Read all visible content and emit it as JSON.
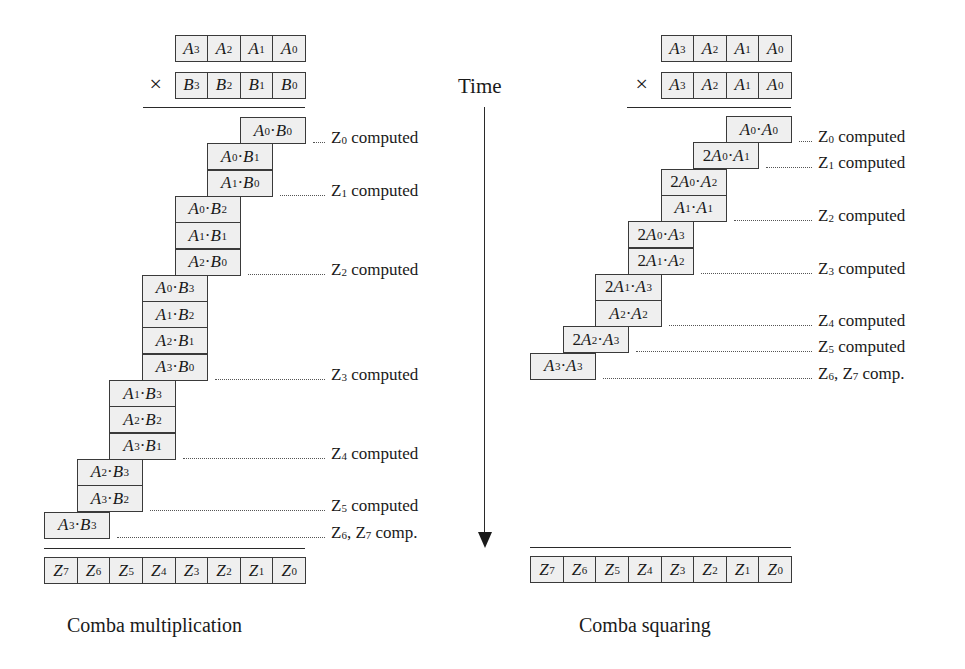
{
  "time_axis": {
    "label": "Time",
    "icon": "down-arrow-icon"
  },
  "multiplication": {
    "caption": "Comba multiplication",
    "times_symbol": "×",
    "operand_a": [
      "A3",
      "A2",
      "A1",
      "A0"
    ],
    "operand_b": [
      "B3",
      "B2",
      "B1",
      "B0"
    ],
    "result": [
      "Z7",
      "Z6",
      "Z5",
      "Z4",
      "Z3",
      "Z2",
      "Z1",
      "Z0"
    ],
    "products": [
      {
        "a": "A0",
        "b": "B0",
        "col": 0
      },
      {
        "a": "A0",
        "b": "B1",
        "col": 1
      },
      {
        "a": "A1",
        "b": "B0",
        "col": 1
      },
      {
        "a": "A0",
        "b": "B2",
        "col": 2
      },
      {
        "a": "A1",
        "b": "B1",
        "col": 2
      },
      {
        "a": "A2",
        "b": "B0",
        "col": 2
      },
      {
        "a": "A0",
        "b": "B3",
        "col": 3
      },
      {
        "a": "A1",
        "b": "B2",
        "col": 3
      },
      {
        "a": "A2",
        "b": "B1",
        "col": 3
      },
      {
        "a": "A3",
        "b": "B0",
        "col": 3
      },
      {
        "a": "A1",
        "b": "B3",
        "col": 4
      },
      {
        "a": "A2",
        "b": "B2",
        "col": 4
      },
      {
        "a": "A3",
        "b": "B1",
        "col": 4
      },
      {
        "a": "A2",
        "b": "B3",
        "col": 5
      },
      {
        "a": "A3",
        "b": "B2",
        "col": 5
      },
      {
        "a": "A3",
        "b": "B3",
        "col": 6
      }
    ],
    "milestones": [
      {
        "after_row": 0,
        "label": "Z0 computed"
      },
      {
        "after_row": 2,
        "label": "Z1 computed"
      },
      {
        "after_row": 5,
        "label": "Z2 computed"
      },
      {
        "after_row": 9,
        "label": "Z3 computed"
      },
      {
        "after_row": 12,
        "label": "Z4 computed"
      },
      {
        "after_row": 14,
        "label": "Z5 computed"
      },
      {
        "after_row": 15,
        "label": "Z6, Z7 comp."
      }
    ]
  },
  "squaring": {
    "caption": "Comba squaring",
    "times_symbol": "×",
    "operand_a": [
      "A3",
      "A2",
      "A1",
      "A0"
    ],
    "operand_b": [
      "A3",
      "A2",
      "A1",
      "A0"
    ],
    "result": [
      "Z7",
      "Z6",
      "Z5",
      "Z4",
      "Z3",
      "Z2",
      "Z1",
      "Z0"
    ],
    "products": [
      {
        "coef": "",
        "a": "A0",
        "b": "A0",
        "col": 0
      },
      {
        "coef": "2",
        "a": "A0",
        "b": "A1",
        "col": 1
      },
      {
        "coef": "2",
        "a": "A0",
        "b": "A2",
        "col": 2
      },
      {
        "coef": "",
        "a": "A1",
        "b": "A1",
        "col": 2
      },
      {
        "coef": "2",
        "a": "A0",
        "b": "A3",
        "col": 3
      },
      {
        "coef": "2",
        "a": "A1",
        "b": "A2",
        "col": 3
      },
      {
        "coef": "2",
        "a": "A1",
        "b": "A3",
        "col": 4
      },
      {
        "coef": "",
        "a": "A2",
        "b": "A2",
        "col": 4
      },
      {
        "coef": "2",
        "a": "A2",
        "b": "A3",
        "col": 5
      },
      {
        "coef": "",
        "a": "A3",
        "b": "A3",
        "col": 6
      }
    ],
    "milestones": [
      {
        "after_row": 0,
        "label": "Z0 computed"
      },
      {
        "after_row": 1,
        "label": "Z1 computed"
      },
      {
        "after_row": 3,
        "label": "Z2 computed"
      },
      {
        "after_row": 5,
        "label": "Z3 computed"
      },
      {
        "after_row": 7,
        "label": "Z4 computed"
      },
      {
        "after_row": 8,
        "label": "Z5 computed"
      },
      {
        "after_row": 9,
        "label": "Z6, Z7 comp."
      }
    ]
  }
}
